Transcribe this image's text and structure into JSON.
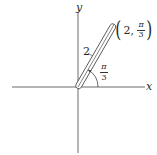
{
  "diagram": {
    "axes": {
      "x_label": "x",
      "y_label": "y",
      "origin": [
        78,
        87
      ]
    },
    "ray": {
      "length_label": "2",
      "angle_label_num": "π",
      "angle_label_den": "3",
      "angle_degrees": 60
    },
    "point": {
      "r": "2,",
      "theta_num": "π",
      "theta_den": "3",
      "label": "(2, π/3)"
    },
    "colors": {
      "line": "#333333",
      "background": "#ffffff"
    }
  }
}
